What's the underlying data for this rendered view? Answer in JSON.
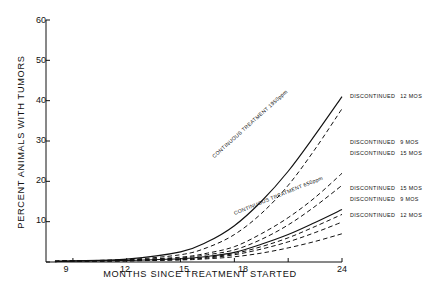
{
  "chart_data": {
    "type": "line",
    "title": "",
    "xlabel": "MONTHS SINCE TREATMENT STARTED",
    "ylabel": "PERCENT ANIMALS WITH TUMORS",
    "xlim": [
      7.5,
      24
    ],
    "ylim": [
      0,
      60
    ],
    "xticks": [
      "9",
      "12",
      "15",
      "18",
      "24"
    ],
    "xtick_values": [
      9,
      12,
      15,
      18,
      24
    ],
    "yticks": [
      "0",
      "10",
      "20",
      "30",
      "40",
      "50",
      "60"
    ],
    "ytick_values": [
      0,
      10,
      20,
      30,
      40,
      50,
      60
    ],
    "grid": false,
    "legend_position": "right-inline",
    "x": [
      8,
      9,
      12,
      15,
      16.5,
      18,
      19.5,
      21,
      22.5,
      24
    ],
    "series": [
      {
        "name": "CONTINUOUS TREATMENT 1950ppm",
        "style": "solid",
        "group": "1950ppm",
        "values": [
          0.2,
          0.3,
          0.7,
          2.5,
          5.0,
          9.0,
          15.0,
          22.5,
          31.5,
          41.0
        ]
      },
      {
        "name": "DISCONTINUED 12 MOS",
        "style": "dashed",
        "group": "1950ppm",
        "values": [
          0.2,
          0.3,
          0.6,
          1.8,
          3.6,
          6.8,
          12.0,
          19.0,
          28.0,
          38.0
        ]
      },
      {
        "name": "DISCONTINUED 9 MOS",
        "style": "dashed",
        "group": "1950ppm",
        "values": [
          0.2,
          0.3,
          0.5,
          1.2,
          2.2,
          3.8,
          7.0,
          11.0,
          16.0,
          22.0
        ]
      },
      {
        "name": "DISCONTINUED 15 MOS",
        "style": "dashed",
        "group": "1950ppm",
        "values": [
          0.2,
          0.3,
          0.5,
          1.0,
          1.8,
          3.0,
          5.6,
          9.2,
          13.8,
          19.0
        ]
      },
      {
        "name": "CONTINUOUS TREATMENT 650ppm",
        "style": "solid",
        "group": "650ppm",
        "values": [
          0.1,
          0.2,
          0.4,
          0.8,
          1.4,
          2.4,
          4.4,
          6.8,
          9.8,
          13.0
        ]
      },
      {
        "name": "DISCONTINUED 15 MOS",
        "style": "dashed",
        "group": "650ppm",
        "values": [
          0.1,
          0.2,
          0.3,
          0.7,
          1.2,
          2.1,
          3.8,
          6.0,
          8.8,
          11.8
        ]
      },
      {
        "name": "DISCONTINUED 9 MOS",
        "style": "dashed",
        "group": "650ppm",
        "values": [
          0.1,
          0.2,
          0.3,
          0.6,
          1.0,
          1.8,
          3.2,
          5.0,
          7.3,
          9.9
        ]
      },
      {
        "name": "DISCONTINUED 12 MOS",
        "style": "dashed",
        "group": "650ppm",
        "values": [
          0.1,
          0.2,
          0.3,
          0.5,
          0.8,
          1.3,
          2.2,
          3.5,
          5.1,
          7.0
        ]
      }
    ]
  },
  "axis": {
    "ylabel": "PERCENT ANIMALS WITH TUMORS",
    "xlabel": "MONTHS SINCE TREATMENT STARTED",
    "yticks": [
      "60",
      "50",
      "40",
      "30",
      "20",
      "10",
      "0"
    ],
    "xticks": [
      "9",
      "12",
      "15",
      "18",
      "24"
    ]
  },
  "inline_labels": [
    {
      "text": "CONTINUOUS TREATMENT 1950ppm"
    },
    {
      "text": "CONTINUOUS TREATMENT 650ppm"
    }
  ],
  "right_labels": [
    {
      "name": "DISCONTINUED",
      "mos": "12 MOS"
    },
    {
      "name": "DISCONTINUED",
      "mos": "9 MOS"
    },
    {
      "name": "DISCONTINUED",
      "mos": "15 MOS"
    },
    {
      "name": "DISCONTINUED",
      "mos": "15 MOS"
    },
    {
      "name": "DISCONTINUED",
      "mos": "9 MOS"
    },
    {
      "name": "DISCONTINUED",
      "mos": "12 MOS"
    }
  ],
  "colors": {
    "ink": "#111111",
    "background": "#ffffff"
  }
}
